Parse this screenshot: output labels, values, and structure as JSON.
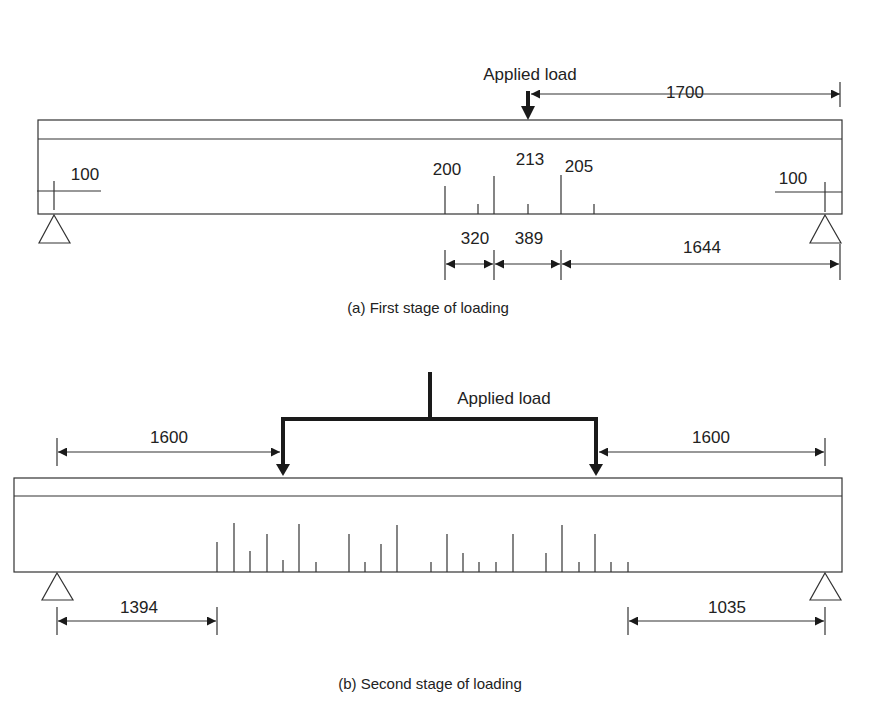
{
  "figure_a": {
    "caption": "(a) First stage of loading",
    "load_label": "Applied load",
    "beam": {
      "x1": 38,
      "x2": 842,
      "top": 120,
      "flange": 139,
      "bottom": 214
    },
    "supports_x": [
      55,
      825
    ],
    "load_x": 528,
    "dim_top": {
      "label": "1700",
      "x1": 528,
      "x2": 840,
      "y": 147
    },
    "tick_left": {
      "label": "100"
    },
    "tick_right": {
      "label": "100"
    },
    "crack_labels": [
      {
        "label": "200",
        "x": 447,
        "y": 175
      },
      {
        "label": "213",
        "x": 530,
        "y": 165
      },
      {
        "label": "205",
        "x": 579,
        "y": 172
      }
    ],
    "cracks": [
      {
        "x": 445,
        "top": 186
      },
      {
        "x": 478,
        "top": 204
      },
      {
        "x": 494,
        "top": 176
      },
      {
        "x": 528,
        "top": 204
      },
      {
        "x": 561,
        "top": 175
      },
      {
        "x": 594,
        "top": 204
      }
    ],
    "dims_bottom": [
      {
        "label": "320",
        "x1": 445,
        "x2": 494
      },
      {
        "label": "389",
        "x1": 494,
        "x2": 561
      },
      {
        "label": "1644",
        "x1": 561,
        "x2": 840
      }
    ]
  },
  "figure_b": {
    "caption": "(b) Second stage of loading",
    "load_label": "Applied load",
    "beam": {
      "x1": 14,
      "x2": 842,
      "top": 478,
      "flange": 496,
      "bottom": 572
    },
    "supports_x": [
      57,
      825
    ],
    "load_points_x": [
      283,
      596
    ],
    "dim_left": {
      "label": "1600"
    },
    "dim_right": {
      "label": "1600"
    },
    "dim_bottom_left": {
      "label": "1394"
    },
    "dim_bottom_right": {
      "label": "1035"
    },
    "cracks": [
      {
        "x": 217,
        "top": 542
      },
      {
        "x": 234,
        "top": 523
      },
      {
        "x": 250,
        "top": 551
      },
      {
        "x": 267,
        "top": 534
      },
      {
        "x": 283,
        "top": 560
      },
      {
        "x": 299,
        "top": 524
      },
      {
        "x": 316,
        "top": 562
      },
      {
        "x": 349,
        "top": 534
      },
      {
        "x": 365,
        "top": 562
      },
      {
        "x": 381,
        "top": 544
      },
      {
        "x": 397,
        "top": 525
      },
      {
        "x": 431,
        "top": 562
      },
      {
        "x": 447,
        "top": 534
      },
      {
        "x": 463,
        "top": 553
      },
      {
        "x": 479,
        "top": 562
      },
      {
        "x": 496,
        "top": 562
      },
      {
        "x": 513,
        "top": 534
      },
      {
        "x": 546,
        "top": 553
      },
      {
        "x": 562,
        "top": 525
      },
      {
        "x": 579,
        "top": 562
      },
      {
        "x": 595,
        "top": 534
      },
      {
        "x": 611,
        "top": 562
      },
      {
        "x": 628,
        "top": 562
      }
    ]
  }
}
